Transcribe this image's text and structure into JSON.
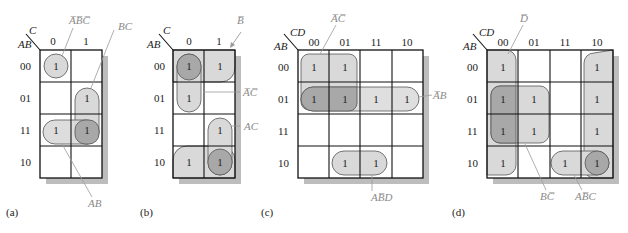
{
  "figures": [
    {
      "id": "a",
      "caption": "(a)",
      "var_row": "AB",
      "var_col": "C",
      "col_labels": [
        "0",
        "1"
      ],
      "row_labels": [
        "00",
        "01",
        "11",
        "10"
      ],
      "cells": [
        [
          "1",
          ""
        ],
        [
          "",
          "1"
        ],
        [
          "1",
          "1"
        ],
        [
          "",
          ""
        ]
      ],
      "groups": [
        {
          "label": "A̅B̅C̅",
          "term": "ABC-bar-all"
        },
        {
          "label": "BC",
          "term": "BC"
        },
        {
          "label": "AB",
          "term": "AB"
        }
      ]
    },
    {
      "id": "b",
      "caption": "(b)",
      "var_row": "AB",
      "var_col": "C",
      "col_labels": [
        "0",
        "1"
      ],
      "row_labels": [
        "00",
        "01",
        "11",
        "10"
      ],
      "cells": [
        [
          "1",
          "1"
        ],
        [
          "1",
          ""
        ],
        [
          "",
          "1"
        ],
        [
          "1",
          "1"
        ]
      ],
      "groups": [
        {
          "label": "B̅",
          "term": "B-bar"
        },
        {
          "label": "A̅C̅",
          "term": "A-bar C-bar"
        },
        {
          "label": "AC",
          "term": "AC"
        }
      ]
    },
    {
      "id": "c",
      "caption": "(c)",
      "var_row": "AB",
      "var_col": "CD",
      "col_labels": [
        "00",
        "01",
        "11",
        "10"
      ],
      "row_labels": [
        "00",
        "01",
        "11",
        "10"
      ],
      "cells": [
        [
          "1",
          "1",
          "",
          ""
        ],
        [
          "1",
          "1",
          "1",
          "1"
        ],
        [
          "",
          "",
          "",
          ""
        ],
        [
          "",
          "1",
          "1",
          ""
        ]
      ],
      "groups": [
        {
          "label": "A̅C̅",
          "term": "A-bar C-bar"
        },
        {
          "label": "A̅B",
          "term": "A-bar B"
        },
        {
          "label": "AB̅D",
          "term": "A B-bar D"
        }
      ]
    },
    {
      "id": "d",
      "caption": "(d)",
      "var_row": "AB",
      "var_col": "CD",
      "col_labels": [
        "00",
        "01",
        "11",
        "10"
      ],
      "row_labels": [
        "00",
        "01",
        "11",
        "10"
      ],
      "cells": [
        [
          "1",
          "",
          "",
          "1"
        ],
        [
          "1",
          "1",
          "",
          "1"
        ],
        [
          "1",
          "1",
          "",
          "1"
        ],
        [
          "1",
          "",
          "1",
          "1"
        ]
      ],
      "groups": [
        {
          "label": "D̅",
          "term": "D-bar"
        },
        {
          "label": "BC̅",
          "term": "B C-bar"
        },
        {
          "label": "AB̅C",
          "term": "A B-bar C"
        }
      ]
    }
  ],
  "colors": {
    "group_fill": "#d9d9d9",
    "group_overlap": "#a8a8a8",
    "shadow": "#bdbdbd",
    "leader": "#9a9a9a",
    "grid": "#111111"
  }
}
